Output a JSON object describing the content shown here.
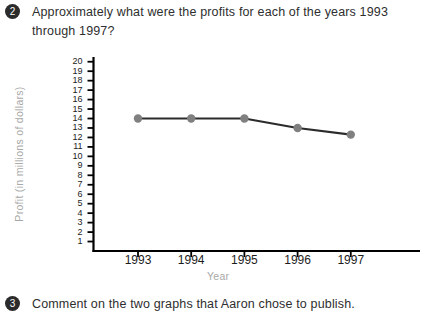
{
  "questions": [
    {
      "number": "2",
      "text": "Approximately what were the profits for each of the years 1993 through 1997?"
    },
    {
      "number": "3",
      "text": "Comment on the two graphs that Aaron chose to publish."
    }
  ],
  "chart_data": {
    "type": "line",
    "title": "",
    "xlabel": "Year",
    "ylabel": "Profit (in millions of dollars)",
    "categories": [
      "1993",
      "1994",
      "1995",
      "1996",
      "1997"
    ],
    "values": [
      14,
      14,
      14,
      13,
      12.3
    ],
    "ylim": [
      0,
      20.5
    ],
    "y_ticks": [
      "1",
      "2",
      "3",
      "4",
      "5",
      "6",
      "7",
      "8",
      "9",
      "10",
      "11",
      "12",
      "13",
      "14",
      "15",
      "16",
      "17",
      "18",
      "19",
      "20"
    ],
    "grid": false,
    "legend": false,
    "line_color": "#2b2b2b",
    "marker_color": "#808080",
    "axis_color": "#000000",
    "axis_title_color": "#a8a8a8"
  }
}
